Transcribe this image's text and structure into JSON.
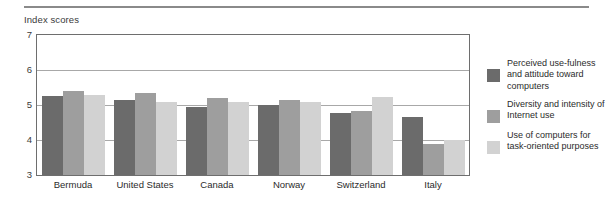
{
  "figure": {
    "axis_title": "Index scores"
  },
  "legend": {
    "items": [
      {
        "name": "series-perceived-usefulness",
        "label": "Perceived use-fulness and attitude toward computers",
        "color": "#6b6b6b"
      },
      {
        "name": "series-diversity-intensity",
        "label": "Diversity and intensity of Internet use",
        "color": "#9e9e9e"
      },
      {
        "name": "series-task-oriented",
        "label": "Use of computers for task-oriented purposes",
        "color": "#d2d2d2"
      }
    ]
  },
  "chart_data": {
    "type": "bar",
    "title": "",
    "xlabel": "",
    "ylabel": "Index scores",
    "ylim": [
      3,
      7
    ],
    "yticks": [
      7,
      6,
      5,
      4,
      3
    ],
    "grid": true,
    "legend_position": "right",
    "categories": [
      "Bermuda",
      "United States",
      "Canada",
      "Norway",
      "Switzerland",
      "Italy"
    ],
    "series": [
      {
        "name": "Perceived use-fulness and attitude toward computers",
        "color": "#6b6b6b",
        "values": [
          5.27,
          5.15,
          4.95,
          5.0,
          4.78,
          4.67
        ]
      },
      {
        "name": "Diversity and intensity of Internet use",
        "color": "#9e9e9e",
        "values": [
          5.4,
          5.35,
          5.2,
          5.15,
          4.83,
          3.9
        ]
      },
      {
        "name": "Use of computers for task-oriented purposes",
        "color": "#d2d2d2",
        "values": [
          5.3,
          5.1,
          5.1,
          5.1,
          5.23,
          4.0
        ]
      }
    ]
  }
}
